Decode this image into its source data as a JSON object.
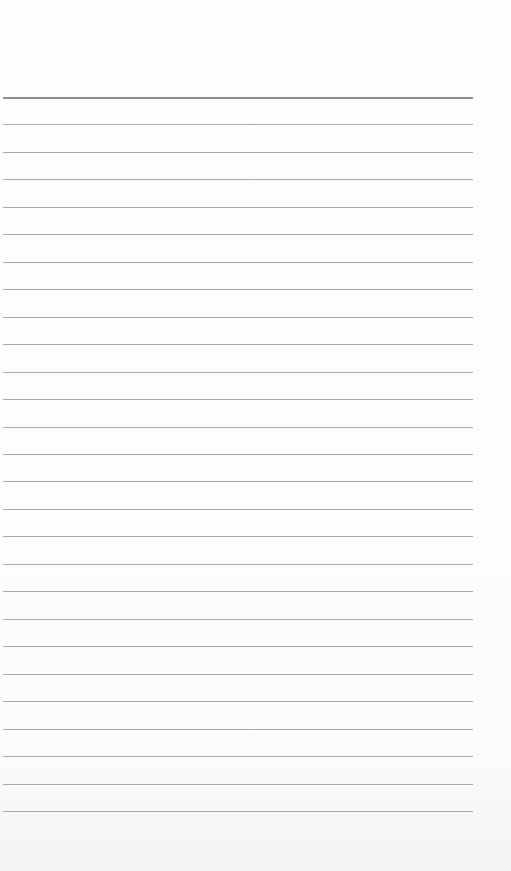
{
  "page": {
    "type": "lined-paper",
    "line_count": 27,
    "first_line_y": 97,
    "line_spacing": 27.46,
    "line_color": "#a9a9a9",
    "top_line_color": "#8f8f8f",
    "background_color": "#fdfdfd"
  }
}
